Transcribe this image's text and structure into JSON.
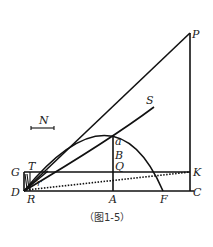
{
  "figure": {
    "caption": "（图1-5）",
    "labels": {
      "P": "P",
      "S": "S",
      "N": "N",
      "a": "a",
      "B": "B",
      "Q": "Q",
      "G": "G",
      "T": "T",
      "K": "K",
      "D": "D",
      "R": "R",
      "A": "A",
      "F": "F",
      "C": "C",
      "r": "r"
    }
  }
}
